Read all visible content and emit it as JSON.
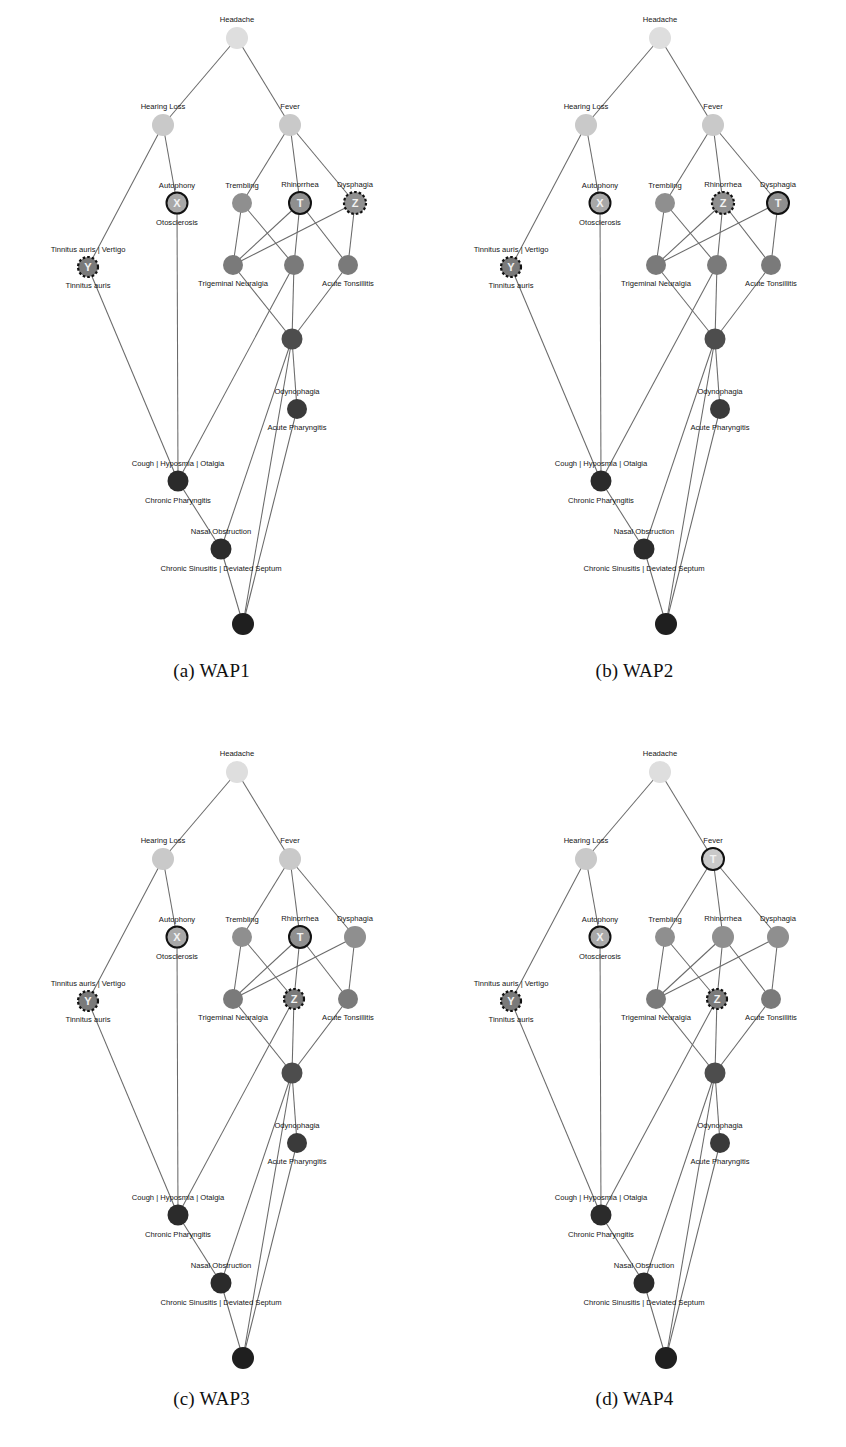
{
  "figure": {
    "panels": [
      {
        "id": "a",
        "caption": "(a) WAP1"
      },
      {
        "id": "b",
        "caption": "(b) WAP2"
      },
      {
        "id": "c",
        "caption": "(c) WAP3"
      },
      {
        "id": "d",
        "caption": "(d) WAP4"
      }
    ]
  },
  "labels": {
    "headache": "Headache",
    "hearing_loss": "Hearing Loss",
    "fever": "Fever",
    "autophony": "Autophony",
    "otosclerosis": "Otosclerosis",
    "trembling": "Trembling",
    "rhinorrhea": "Rhinorrhea",
    "dysphagia": "Dysphagia",
    "tinnitus_vertigo": "Tinnitus auris | Vertigo",
    "tinnitus_auris": "Tinnitus auris",
    "trigeminal": "Trigeminal Neuralgia",
    "acute_tonsillitis": "Acute Tonsillitis",
    "odynophagia": "Odynophagia",
    "acute_pharyngitis": "Acute Pharyngitis",
    "cough_group": "Cough | Hyposmia | Otalgia",
    "chronic_pharyngitis": "Chronic Pharyngitis",
    "nasal_obstruction": "Nasal Obstruction",
    "chronic_sinusitis": "Chronic Sinusitis | Deviated Septum"
  },
  "markers": {
    "x": "X",
    "y": "Y",
    "z": "Z",
    "t": "T"
  },
  "colors": {
    "node_l0": "#dedede",
    "node_l1": "#c9c9c9",
    "node_l2": "#a8a8a8",
    "node_l3": "#8f8f8f",
    "node_l4": "#7a7a7a",
    "node_l5": "#636363",
    "node_l6": "#4d4d4d",
    "node_l7": "#3a3a3a",
    "node_l8": "#2b2b2b",
    "node_l9": "#1f1f1f",
    "edge": "#6a6a6a",
    "marker_ring": "#111111",
    "marker_text": "#f2f2f2",
    "background": "#ffffff"
  },
  "chart_data": {
    "type": "diagram",
    "subtype": "layered-node-link-graph",
    "panel_count": 4,
    "shared_node_layout": [
      {
        "key": "headache",
        "label": "Headache",
        "x": 237,
        "y": 38,
        "r": 11,
        "shade": "node_l0",
        "label_pos": "above"
      },
      {
        "key": "hearing_loss",
        "label": "Hearing Loss",
        "x": 163,
        "y": 125,
        "r": 11,
        "shade": "node_l1",
        "label_pos": "above"
      },
      {
        "key": "fever",
        "label": "Fever",
        "x": 290,
        "y": 125,
        "r": 11,
        "shade": "node_l1",
        "label_pos": "above"
      },
      {
        "key": "autophony",
        "label": "Autophony",
        "x": 177,
        "y": 203,
        "r": 10.5,
        "shade": "node_l2",
        "label_pos": "above",
        "sublabel": "Otosclerosis"
      },
      {
        "key": "trembling",
        "label": "Trembling",
        "x": 242,
        "y": 203,
        "r": 10,
        "shade": "node_l3",
        "label_pos": "above"
      },
      {
        "key": "rhinorrhea",
        "label": "Rhinorrhea",
        "x": 300,
        "y": 203,
        "r": 11,
        "shade": "node_l3",
        "label_pos": "above"
      },
      {
        "key": "dysphagia",
        "label": "Dysphagia",
        "x": 355,
        "y": 203,
        "r": 11,
        "shade": "node_l3",
        "label_pos": "above"
      },
      {
        "key": "tinnitus",
        "label": "Tinnitus auris | Vertigo",
        "x": 88,
        "y": 267,
        "r": 10,
        "shade": "node_l4",
        "label_pos": "above",
        "sublabel": "Tinnitus auris"
      },
      {
        "key": "trigeminal",
        "label": "Trigeminal Neuralgia",
        "x": 233,
        "y": 265,
        "r": 10,
        "shade": "node_l4",
        "label_pos": "below"
      },
      {
        "key": "mid_center",
        "label": "",
        "x": 294,
        "y": 265,
        "r": 10,
        "shade": "node_l4",
        "label_pos": "none"
      },
      {
        "key": "acute_tonsillitis",
        "label": "Acute Tonsillitis",
        "x": 348,
        "y": 265,
        "r": 10,
        "shade": "node_l4",
        "label_pos": "below"
      },
      {
        "key": "hub",
        "label": "",
        "x": 292,
        "y": 339,
        "r": 10.5,
        "shade": "node_l6",
        "label_pos": "none"
      },
      {
        "key": "odynophagia",
        "label": "Odynophagia",
        "x": 297,
        "y": 409,
        "r": 10,
        "shade": "node_l7",
        "label_pos": "above",
        "sublabel": "Acute Pharyngitis"
      },
      {
        "key": "cough",
        "label": "Cough | Hyposmia | Otalgia",
        "x": 178,
        "y": 481,
        "r": 10.5,
        "shade": "node_l8",
        "label_pos": "above",
        "sublabel": "Chronic Pharyngitis"
      },
      {
        "key": "nasal",
        "label": "Nasal Obstruction",
        "x": 221,
        "y": 549,
        "r": 10.5,
        "shade": "node_l8",
        "label_pos": "above",
        "sublabel": "Chronic Sinusitis | Deviated Septum"
      },
      {
        "key": "bottom",
        "label": "",
        "x": 243,
        "y": 624,
        "r": 11,
        "shade": "node_l9",
        "label_pos": "none"
      }
    ],
    "shared_edges": [
      [
        "headache",
        "hearing_loss"
      ],
      [
        "headache",
        "fever"
      ],
      [
        "hearing_loss",
        "tinnitus"
      ],
      [
        "hearing_loss",
        "autophony"
      ],
      [
        "fever",
        "trembling"
      ],
      [
        "fever",
        "rhinorrhea"
      ],
      [
        "fever",
        "dysphagia"
      ],
      [
        "trembling",
        "trigeminal"
      ],
      [
        "trembling",
        "mid_center"
      ],
      [
        "rhinorrhea",
        "trigeminal"
      ],
      [
        "rhinorrhea",
        "mid_center"
      ],
      [
        "rhinorrhea",
        "acute_tonsillitis"
      ],
      [
        "dysphagia",
        "trigeminal"
      ],
      [
        "dysphagia",
        "acute_tonsillitis"
      ],
      [
        "trigeminal",
        "hub"
      ],
      [
        "mid_center",
        "hub"
      ],
      [
        "acute_tonsillitis",
        "hub"
      ],
      [
        "mid_center",
        "cough"
      ],
      [
        "hub",
        "odynophagia"
      ],
      [
        "hub",
        "nasal"
      ],
      [
        "autophony",
        "cough"
      ],
      [
        "tinnitus",
        "cough"
      ],
      [
        "cough",
        "nasal"
      ],
      [
        "nasal",
        "bottom"
      ],
      [
        "odynophagia",
        "bottom"
      ],
      [
        "hub",
        "bottom"
      ]
    ],
    "panel_markers": [
      {
        "panel": "a",
        "caption": "(a) WAP1",
        "markers": [
          {
            "node": "autophony",
            "letter": "X",
            "style": "solid"
          },
          {
            "node": "tinnitus",
            "letter": "Y",
            "style": "dashed"
          },
          {
            "node": "rhinorrhea",
            "letter": "T",
            "style": "solid"
          },
          {
            "node": "dysphagia",
            "letter": "Z",
            "style": "dashed"
          }
        ]
      },
      {
        "panel": "b",
        "caption": "(b) WAP2",
        "markers": [
          {
            "node": "autophony",
            "letter": "X",
            "style": "solid"
          },
          {
            "node": "tinnitus",
            "letter": "Y",
            "style": "dashed"
          },
          {
            "node": "rhinorrhea",
            "letter": "Z",
            "style": "dashed"
          },
          {
            "node": "dysphagia",
            "letter": "T",
            "style": "solid"
          }
        ]
      },
      {
        "panel": "c",
        "caption": "(c) WAP3",
        "markers": [
          {
            "node": "autophony",
            "letter": "X",
            "style": "solid"
          },
          {
            "node": "tinnitus",
            "letter": "Y",
            "style": "dashed"
          },
          {
            "node": "rhinorrhea",
            "letter": "T",
            "style": "solid"
          },
          {
            "node": "mid_center",
            "letter": "Z",
            "style": "dashed"
          }
        ]
      },
      {
        "panel": "d",
        "caption": "(d) WAP4",
        "markers": [
          {
            "node": "autophony",
            "letter": "X",
            "style": "solid"
          },
          {
            "node": "tinnitus",
            "letter": "Y",
            "style": "dashed"
          },
          {
            "node": "fever",
            "letter": "T",
            "style": "solid"
          },
          {
            "node": "mid_center",
            "letter": "Z",
            "style": "dashed"
          }
        ]
      }
    ]
  }
}
